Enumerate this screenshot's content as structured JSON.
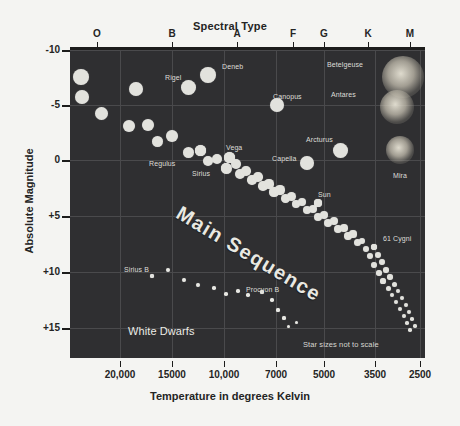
{
  "figure": {
    "top_title": "Spectral Type",
    "bottom_title": "Temperature in degrees Kelvin",
    "y_title": "Absolute Magnitude",
    "note": "Star sizes not to scale",
    "background": "#f4f4f2",
    "plot_background": "#2f2f31",
    "grid_color": "#4a4a4c",
    "star_color": "#e2e2dd"
  },
  "chart_data": {
    "type": "scatter",
    "title": "Spectral Type",
    "xlabel": "Temperature in degrees Kelvin",
    "ylabel": "Absolute Magnitude",
    "grid": true,
    "legend": "none",
    "xlim": [
      30000,
      2400
    ],
    "ylim": [
      -11,
      17
    ],
    "x_axis_inverted": true,
    "y_axis_inverted": true,
    "xticks": [
      "20,000",
      "15000",
      "10,000",
      "7000",
      "5000",
      "3500",
      "2500"
    ],
    "xtick_values": [
      20000,
      15000,
      10000,
      7000,
      5000,
      3500,
      2500
    ],
    "xtick_px": [
      120,
      172,
      224,
      276,
      324,
      375,
      420
    ],
    "yticks": [
      "-10",
      "-5",
      "0",
      "+5",
      "+10",
      "+15"
    ],
    "ytick_values": [
      -10,
      -5,
      0,
      5,
      10,
      15
    ],
    "ytick_px": [
      50,
      105,
      160,
      216,
      272,
      328
    ],
    "spectral_types": [
      "O",
      "B",
      "A",
      "F",
      "G",
      "K",
      "M"
    ],
    "spectral_px": [
      97,
      172,
      237,
      293,
      324,
      368,
      410
    ],
    "annotations": [
      {
        "text": "Main Sequence",
        "kind": "band-label",
        "rotation": 31
      },
      {
        "text": "White Dwarfs",
        "kind": "group-label"
      },
      {
        "text": "Star sizes not to scale",
        "kind": "note"
      }
    ],
    "named_stars": [
      {
        "name": "Rigel",
        "label_x": 165,
        "label_y": 74,
        "px": 188,
        "py": 87,
        "r": 7.5,
        "group": "supergiant"
      },
      {
        "name": "Deneb",
        "label_x": 222,
        "label_y": 63,
        "px": 208,
        "py": 75,
        "r": 8.0,
        "group": "supergiant"
      },
      {
        "name": "Betelgeuse",
        "label_x": 327,
        "label_y": 61,
        "px": 403,
        "py": 77,
        "r": 21,
        "group": "supergiant-glow"
      },
      {
        "name": "Antares",
        "label_x": 331,
        "label_y": 91,
        "px": 397,
        "py": 107,
        "r": 17,
        "group": "supergiant-glow"
      },
      {
        "name": "Canopus",
        "label_x": 273,
        "label_y": 93,
        "px": 277,
        "py": 105,
        "r": 7.0,
        "group": "supergiant"
      },
      {
        "name": "Arcturus",
        "label_x": 306,
        "label_y": 136,
        "px": 340,
        "py": 150,
        "r": 7.5,
        "group": "giant"
      },
      {
        "name": "Capella",
        "label_x": 272,
        "label_y": 155,
        "px": 307,
        "py": 163,
        "r": 7.0,
        "group": "giant"
      },
      {
        "name": "Mira",
        "label_x": 393,
        "label_y": 172,
        "px": 400,
        "py": 150,
        "r": 14,
        "group": "giant-glow"
      },
      {
        "name": "Vega",
        "label_x": 226,
        "label_y": 144,
        "px": 229,
        "py": 157,
        "r": 5.5,
        "group": "main-sequence"
      },
      {
        "name": "Sirius",
        "label_x": 192,
        "label_y": 170,
        "px": 226,
        "py": 168,
        "r": 5.5,
        "group": "main-sequence"
      },
      {
        "name": "Regulus",
        "label_x": 149,
        "label_y": 160,
        "px": 200,
        "py": 150,
        "r": 5.5,
        "group": "main-sequence"
      },
      {
        "name": "Sun",
        "label_x": 318,
        "label_y": 191,
        "px": 318,
        "py": 203,
        "r": 4.2,
        "group": "main-sequence"
      },
      {
        "name": "61 Cygni",
        "label_x": 383,
        "label_y": 235,
        "px": 374,
        "py": 247,
        "r": 3.2,
        "group": "main-sequence"
      },
      {
        "name": "Sirius B",
        "label_x": 124,
        "label_y": 266,
        "px": 152,
        "py": 276,
        "r": 2.0,
        "group": "white-dwarf"
      },
      {
        "name": "Procyon B",
        "label_x": 246,
        "label_y": 286,
        "px": 262,
        "py": 292,
        "r": 1.8,
        "group": "white-dwarf"
      }
    ],
    "supergiant_points": [
      {
        "x": 81,
        "y": 77,
        "r": 8.0
      },
      {
        "x": 82,
        "y": 97,
        "r": 7.0
      },
      {
        "x": 101,
        "y": 113,
        "r": 6.5
      },
      {
        "x": 129,
        "y": 126,
        "r": 6.0
      },
      {
        "x": 136,
        "y": 89,
        "r": 7.0
      },
      {
        "x": 148,
        "y": 125,
        "r": 6.0
      },
      {
        "x": 157,
        "y": 141,
        "r": 5.5
      },
      {
        "x": 172,
        "y": 136,
        "r": 6.0
      }
    ],
    "main_sequence_points": [
      {
        "x": 188,
        "y": 152,
        "r": 5.5
      },
      {
        "x": 200,
        "y": 150,
        "r": 5.5
      },
      {
        "x": 208,
        "y": 161,
        "r": 5.0
      },
      {
        "x": 217,
        "y": 159,
        "r": 5.0
      },
      {
        "x": 226,
        "y": 168,
        "r": 5.0
      },
      {
        "x": 229,
        "y": 157,
        "r": 5.5
      },
      {
        "x": 236,
        "y": 164,
        "r": 5.0
      },
      {
        "x": 240,
        "y": 174,
        "r": 5.0
      },
      {
        "x": 246,
        "y": 171,
        "r": 4.8
      },
      {
        "x": 252,
        "y": 180,
        "r": 4.8
      },
      {
        "x": 258,
        "y": 177,
        "r": 4.8
      },
      {
        "x": 263,
        "y": 186,
        "r": 4.8
      },
      {
        "x": 269,
        "y": 184,
        "r": 4.6
      },
      {
        "x": 274,
        "y": 192,
        "r": 4.6
      },
      {
        "x": 280,
        "y": 190,
        "r": 4.6
      },
      {
        "x": 285,
        "y": 198,
        "r": 4.5
      },
      {
        "x": 291,
        "y": 196,
        "r": 4.5
      },
      {
        "x": 296,
        "y": 204,
        "r": 4.4
      },
      {
        "x": 302,
        "y": 202,
        "r": 4.4
      },
      {
        "x": 307,
        "y": 210,
        "r": 4.3
      },
      {
        "x": 313,
        "y": 209,
        "r": 4.3
      },
      {
        "x": 318,
        "y": 203,
        "r": 4.2
      },
      {
        "x": 318,
        "y": 217,
        "r": 4.2
      },
      {
        "x": 324,
        "y": 215,
        "r": 4.1
      },
      {
        "x": 328,
        "y": 223,
        "r": 4.1
      },
      {
        "x": 334,
        "y": 221,
        "r": 4.0
      },
      {
        "x": 338,
        "y": 229,
        "r": 3.9
      },
      {
        "x": 344,
        "y": 228,
        "r": 3.8
      },
      {
        "x": 348,
        "y": 236,
        "r": 3.7
      },
      {
        "x": 353,
        "y": 234,
        "r": 3.6
      },
      {
        "x": 357,
        "y": 242,
        "r": 3.5
      },
      {
        "x": 362,
        "y": 241,
        "r": 3.4
      },
      {
        "x": 366,
        "y": 249,
        "r": 3.3
      },
      {
        "x": 374,
        "y": 247,
        "r": 3.2
      },
      {
        "x": 370,
        "y": 256,
        "r": 3.1
      },
      {
        "x": 378,
        "y": 255,
        "r": 3.0
      },
      {
        "x": 382,
        "y": 262,
        "r": 2.9
      },
      {
        "x": 374,
        "y": 265,
        "r": 2.9
      },
      {
        "x": 386,
        "y": 270,
        "r": 2.8
      },
      {
        "x": 379,
        "y": 273,
        "r": 2.7
      },
      {
        "x": 390,
        "y": 277,
        "r": 2.7
      },
      {
        "x": 383,
        "y": 281,
        "r": 2.6
      },
      {
        "x": 394,
        "y": 284,
        "r": 2.5
      },
      {
        "x": 388,
        "y": 288,
        "r": 2.5
      },
      {
        "x": 398,
        "y": 291,
        "r": 2.4
      },
      {
        "x": 392,
        "y": 295,
        "r": 2.3
      },
      {
        "x": 402,
        "y": 298,
        "r": 2.2
      },
      {
        "x": 396,
        "y": 302,
        "r": 2.2
      },
      {
        "x": 406,
        "y": 305,
        "r": 2.1
      },
      {
        "x": 400,
        "y": 309,
        "r": 2.0
      },
      {
        "x": 409,
        "y": 312,
        "r": 2.0
      },
      {
        "x": 404,
        "y": 316,
        "r": 1.9
      },
      {
        "x": 412,
        "y": 319,
        "r": 1.8
      },
      {
        "x": 407,
        "y": 323,
        "r": 1.8
      },
      {
        "x": 415,
        "y": 326,
        "r": 1.7
      },
      {
        "x": 410,
        "y": 330,
        "r": 1.7
      }
    ],
    "white_dwarf_points": [
      {
        "x": 152,
        "y": 276,
        "r": 2.0
      },
      {
        "x": 168,
        "y": 270,
        "r": 2.0
      },
      {
        "x": 184,
        "y": 280,
        "r": 1.9
      },
      {
        "x": 198,
        "y": 285,
        "r": 1.9
      },
      {
        "x": 214,
        "y": 288,
        "r": 1.8
      },
      {
        "x": 226,
        "y": 294,
        "r": 1.8
      },
      {
        "x": 238,
        "y": 291,
        "r": 1.8
      },
      {
        "x": 248,
        "y": 295,
        "r": 1.7
      },
      {
        "x": 262,
        "y": 292,
        "r": 1.8
      },
      {
        "x": 272,
        "y": 300,
        "r": 1.7
      },
      {
        "x": 278,
        "y": 310,
        "r": 1.6
      },
      {
        "x": 284,
        "y": 318,
        "r": 1.6
      },
      {
        "x": 288,
        "y": 326,
        "r": 1.5
      },
      {
        "x": 296,
        "y": 322,
        "r": 1.5
      }
    ]
  }
}
